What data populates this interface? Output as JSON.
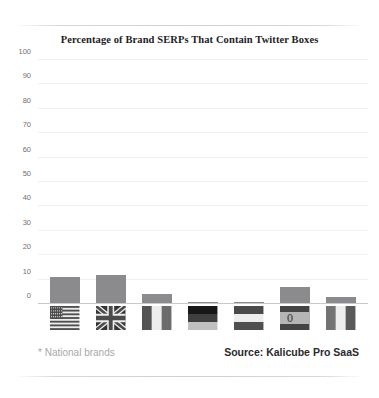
{
  "chart_data": {
    "type": "bar",
    "title": "Percentage of Brand SERPs That Contain Twitter Boxes",
    "xlabel": "",
    "ylabel": "",
    "ylim": [
      0,
      100
    ],
    "yticks": [
      100,
      90,
      80,
      70,
      60,
      50,
      40,
      30,
      20,
      10,
      0
    ],
    "grid": true,
    "legend": "none",
    "categories": [
      "United States",
      "United Kingdom",
      "France",
      "Germany",
      "Netherlands",
      "Spain",
      "Italy"
    ],
    "category_icons": [
      "flag-us-icon",
      "flag-uk-icon",
      "flag-fr-icon",
      "flag-de-icon",
      "flag-nl-icon",
      "flag-es-icon",
      "flag-it-icon"
    ],
    "values": [
      11,
      12,
      4,
      1,
      1,
      7,
      3
    ],
    "bar_color": "#8b8b8d",
    "gridline_color": "#f1f1f2",
    "axis_color": "#c9c9cb"
  },
  "footer": {
    "note": "* National brands",
    "source": "Source: Kalicube Pro SaaS"
  }
}
